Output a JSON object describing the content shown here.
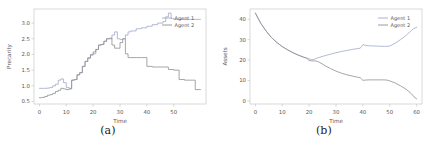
{
  "figure": {
    "panels": [
      {
        "caption": "(a)",
        "chart_data": {
          "type": "line",
          "title": "",
          "xlabel": "Time",
          "ylabel": "Precarity",
          "xlim": [
            -2,
            62
          ],
          "ylim": [
            0.42,
            3.45
          ],
          "xticks": [
            0,
            10,
            20,
            30,
            40,
            50
          ],
          "yticks": [
            "0.5",
            "1.0",
            "1.5",
            "2.0",
            "2.5",
            "3.0"
          ],
          "ytick_values": [
            0.5,
            1.0,
            1.5,
            2.0,
            2.5,
            3.0
          ],
          "grid": false,
          "legend_position": "upper right",
          "step_style": "piecewise-constant",
          "series": [
            {
              "name": "Agent 1",
              "color": "#9fa8c8",
              "x": [
                0,
                1,
                2,
                3,
                4,
                5,
                6,
                7,
                8,
                9,
                10,
                11,
                12,
                13,
                14,
                15,
                16,
                17,
                18,
                19,
                20,
                21,
                22,
                23,
                24,
                25,
                26,
                27,
                28,
                29,
                30,
                31,
                32,
                33,
                34,
                36,
                38,
                40,
                42,
                44,
                46,
                47,
                48,
                49,
                50,
                52,
                54,
                56,
                58,
                60
              ],
              "y": [
                0.92,
                0.92,
                0.92,
                0.93,
                0.95,
                1.0,
                1.05,
                1.18,
                1.22,
                1.1,
                0.95,
                0.92,
                1.18,
                1.2,
                1.35,
                1.42,
                1.62,
                1.78,
                1.9,
                2.0,
                2.02,
                2.16,
                2.3,
                2.32,
                2.42,
                2.5,
                2.5,
                2.62,
                2.72,
                2.5,
                2.48,
                2.5,
                2.62,
                2.72,
                2.75,
                2.82,
                2.85,
                2.9,
                2.95,
                3.0,
                3.05,
                3.2,
                3.32,
                3.15,
                3.12,
                3.12,
                3.12,
                3.12,
                3.12,
                3.12
              ]
            },
            {
              "name": "Agent 2",
              "color": "#8f8f8f",
              "x": [
                0,
                1,
                2,
                3,
                4,
                5,
                6,
                7,
                8,
                9,
                10,
                11,
                12,
                13,
                14,
                15,
                16,
                17,
                18,
                19,
                20,
                21,
                22,
                23,
                24,
                25,
                26,
                27,
                28,
                29,
                30,
                31,
                32,
                33,
                34,
                36,
                38,
                39,
                40,
                42,
                44,
                46,
                48,
                50,
                52,
                54,
                56,
                57,
                58,
                60
              ],
              "y": [
                0.62,
                0.63,
                0.66,
                0.7,
                0.72,
                0.76,
                0.82,
                0.86,
                0.92,
                0.9,
                0.88,
                0.9,
                1.18,
                1.2,
                1.35,
                1.42,
                1.62,
                1.78,
                1.88,
                1.98,
                2.08,
                2.16,
                2.3,
                2.32,
                2.42,
                2.5,
                2.52,
                2.3,
                2.2,
                2.2,
                2.38,
                2.5,
                2.02,
                1.9,
                1.9,
                1.9,
                1.9,
                1.9,
                1.62,
                1.6,
                1.6,
                1.6,
                1.52,
                1.5,
                1.2,
                1.18,
                1.18,
                1.18,
                0.88,
                0.88
              ]
            }
          ]
        }
      },
      {
        "caption": "(b)",
        "chart_data": {
          "type": "line",
          "title": "",
          "xlabel": "Time",
          "ylabel": "Assets",
          "xlim": [
            -2,
            62
          ],
          "ylim": [
            -1.5,
            45
          ],
          "xticks": [
            0,
            10,
            20,
            30,
            40,
            50,
            60
          ],
          "yticks": [
            "0",
            "10",
            "20",
            "30",
            "40"
          ],
          "ytick_values": [
            0,
            10,
            20,
            30,
            40
          ],
          "grid": false,
          "legend_position": "upper right",
          "step_style": "smooth",
          "series": [
            {
              "name": "Agent 1",
              "color": "#9fa8c8",
              "x": [
                0,
                2,
                4,
                6,
                8,
                10,
                12,
                14,
                16,
                18,
                19,
                20,
                21,
                22,
                23,
                24,
                26,
                28,
                30,
                32,
                34,
                36,
                38,
                39,
                40,
                41,
                42,
                44,
                46,
                48,
                49,
                50,
                52,
                54,
                56,
                58,
                59,
                60
              ],
              "y": [
                43.0,
                38.0,
                34.2,
                31.0,
                28.6,
                26.6,
                25.0,
                23.6,
                22.4,
                21.4,
                21.0,
                20.6,
                20.2,
                20.4,
                21.0,
                21.4,
                22.2,
                22.9,
                23.6,
                24.2,
                24.7,
                25.2,
                25.6,
                25.8,
                27.6,
                27.2,
                27.0,
                26.9,
                26.8,
                26.7,
                26.7,
                26.9,
                28.2,
                30.0,
                32.0,
                34.4,
                35.5,
                36.0
              ]
            },
            {
              "name": "Agent 2",
              "color": "#8f8f8f",
              "x": [
                0,
                2,
                4,
                6,
                8,
                10,
                12,
                14,
                16,
                18,
                19,
                20,
                21,
                22,
                23,
                24,
                26,
                28,
                30,
                32,
                34,
                36,
                38,
                39,
                40,
                41,
                42,
                44,
                46,
                48,
                49,
                50,
                52,
                54,
                56,
                58,
                59,
                60
              ],
              "y": [
                43.0,
                38.0,
                34.2,
                31.0,
                28.6,
                26.6,
                25.0,
                23.6,
                22.4,
                21.4,
                21.0,
                19.8,
                19.6,
                19.6,
                19.4,
                18.8,
                17.2,
                15.8,
                14.6,
                13.6,
                12.8,
                12.2,
                11.6,
                11.4,
                10.1,
                10.2,
                10.3,
                10.3,
                10.3,
                10.3,
                10.2,
                9.8,
                8.8,
                7.4,
                5.8,
                3.6,
                2.0,
                1.0
              ]
            }
          ]
        }
      }
    ]
  }
}
